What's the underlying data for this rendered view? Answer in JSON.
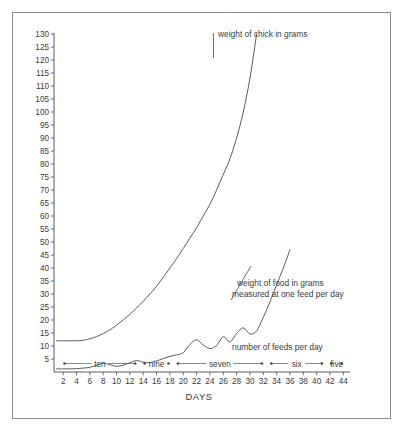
{
  "figure": {
    "background_color": "#ffffff",
    "line_color": "#4a4a4a",
    "text_color": "#3a3a3a",
    "border_color": "#8d8d8d"
  },
  "chart_data": {
    "type": "line",
    "title": "",
    "xlabel": "DAYS",
    "ylabel": "",
    "xlim": [
      1,
      45
    ],
    "ylim": [
      0,
      133
    ],
    "grid": false,
    "legend": "inline-annotations",
    "x_ticks": [
      2,
      4,
      6,
      8,
      10,
      12,
      14,
      16,
      18,
      20,
      22,
      24,
      26,
      28,
      30,
      32,
      34,
      36,
      38,
      40,
      42,
      44
    ],
    "y_ticks": [
      5,
      10,
      15,
      20,
      25,
      30,
      35,
      40,
      45,
      50,
      55,
      60,
      65,
      70,
      75,
      80,
      85,
      90,
      95,
      100,
      105,
      110,
      115,
      120,
      125,
      130
    ],
    "series": [
      {
        "name": "weight of chick in grams",
        "label": "weight of chick in grams",
        "x": [
          1,
          2,
          3,
          4,
          5,
          6,
          7,
          8,
          9,
          10,
          11,
          12,
          13,
          14,
          15,
          16,
          17,
          18,
          19,
          20,
          21,
          22,
          23,
          24,
          25,
          26,
          27,
          28,
          29,
          30,
          31
        ],
        "values": [
          12,
          12,
          12,
          12,
          12.2,
          12.8,
          13.6,
          14.8,
          16.2,
          18,
          20,
          22.2,
          24.6,
          27.2,
          30,
          33,
          36.4,
          40,
          43.6,
          47.5,
          51.5,
          55.5,
          60,
          64.5,
          70,
          76,
          82,
          90,
          100,
          113,
          130
        ]
      },
      {
        "name": "weight of food in grams measured at one feed per day",
        "label": "weight of food in grams\nmeasured at one feed per day",
        "x": [
          1,
          2,
          3,
          4,
          5,
          6,
          7,
          8,
          9,
          10,
          11,
          12,
          13,
          14,
          15,
          16,
          17,
          18,
          19,
          20,
          21,
          22,
          23,
          24,
          25,
          26,
          27,
          28,
          29,
          30,
          31,
          32,
          33,
          34,
          35,
          36
        ],
        "values": [
          1.2,
          1.2,
          1.2,
          1.3,
          1.5,
          1.8,
          2.6,
          3.4,
          2.8,
          2.2,
          2.6,
          3.6,
          4.4,
          3.8,
          3.6,
          4.2,
          5.2,
          6.0,
          6.6,
          7.4,
          10.6,
          12.4,
          10.4,
          9.0,
          10.2,
          13.6,
          11.6,
          14.8,
          17.0,
          14.6,
          15.8,
          21.0,
          27.0,
          33.5,
          40.0,
          47.0
        ]
      }
    ],
    "annotations": [
      {
        "text": "weight of chick in grams",
        "x": 30,
        "y": 126
      },
      {
        "text": "weight of food in grams",
        "x": 33,
        "y": 38
      },
      {
        "text": "measured at one feed per day",
        "x": 33,
        "y": 33
      },
      {
        "text": "number of feeds per day",
        "x": 33,
        "y": 10
      }
    ],
    "feed_bands": [
      {
        "label": "ten",
        "start_day": 2,
        "end_day": 13
      },
      {
        "label": "nine",
        "start_day": 14,
        "end_day": 18
      },
      {
        "label": "seven",
        "start_day": 19,
        "end_day": 32
      },
      {
        "label": "six",
        "start_day": 33,
        "end_day": 41
      },
      {
        "label": "five",
        "start_day": 42,
        "end_day": 44
      }
    ]
  }
}
